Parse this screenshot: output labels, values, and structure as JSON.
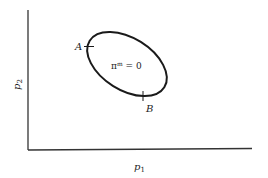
{
  "diagram": {
    "x_axis_label": "p",
    "x_axis_sub": "1",
    "y_axis_label": "p",
    "y_axis_sub": "2",
    "curve_label_base": "π",
    "curve_label_sup": "m",
    "curve_label_rest": " = 0",
    "point_a": "A",
    "point_b": "B"
  },
  "colors": {
    "stroke": "#1a1a1a",
    "axis": "#333333"
  }
}
